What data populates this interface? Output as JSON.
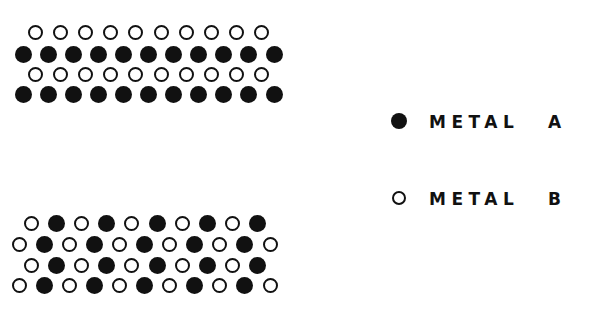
{
  "diagram": {
    "type": "metal-alloy-lattice",
    "lattices": [
      {
        "name": "ordered-layered-alloy",
        "description": "Alternating rows of metal B and metal A",
        "rows": [
          {
            "offset": "half",
            "atoms": [
              "B",
              "B",
              "B",
              "B",
              "B",
              "B",
              "B",
              "B",
              "B",
              "B"
            ]
          },
          {
            "offset": "none",
            "atoms": [
              "A",
              "A",
              "A",
              "A",
              "A",
              "A",
              "A",
              "A",
              "A",
              "A",
              "A"
            ]
          },
          {
            "offset": "half",
            "atoms": [
              "B",
              "B",
              "B",
              "B",
              "B",
              "B",
              "B",
              "B",
              "B",
              "B"
            ]
          },
          {
            "offset": "none",
            "atoms": [
              "A",
              "A",
              "A",
              "A",
              "A",
              "A",
              "A",
              "A",
              "A",
              "A",
              "A"
            ]
          }
        ]
      },
      {
        "name": "ordered-alternating-alloy",
        "description": "Alternating atoms of metal B and metal A within each row",
        "rows": [
          {
            "offset": "half",
            "atoms": [
              "B",
              "A",
              "B",
              "A",
              "B",
              "A",
              "B",
              "A",
              "B",
              "A"
            ]
          },
          {
            "offset": "none",
            "atoms": [
              "B",
              "A",
              "B",
              "A",
              "B",
              "A",
              "B",
              "A",
              "B",
              "A",
              "B"
            ]
          },
          {
            "offset": "half",
            "atoms": [
              "B",
              "A",
              "B",
              "A",
              "B",
              "A",
              "B",
              "A",
              "B",
              "A"
            ]
          },
          {
            "offset": "none",
            "atoms": [
              "B",
              "A",
              "B",
              "A",
              "B",
              "A",
              "B",
              "A",
              "B",
              "A",
              "B"
            ]
          }
        ]
      }
    ]
  },
  "legend": {
    "items": [
      {
        "symbol": "filled-circle",
        "label": "METAL",
        "letter": "A",
        "key": "A"
      },
      {
        "symbol": "open-circle",
        "label": "METAL",
        "letter": "B",
        "key": "B"
      }
    ]
  },
  "colors": {
    "ink": "#111111",
    "background": "#ffffff"
  }
}
